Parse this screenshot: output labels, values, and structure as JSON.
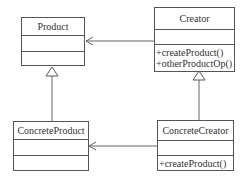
{
  "diagram": {
    "type": "uml-class-diagram",
    "classes": [
      {
        "id": "product",
        "name": "Product",
        "attributes": [],
        "operations": []
      },
      {
        "id": "creator",
        "name": "Creator",
        "attributes": [],
        "operations": [
          "+createProduct()",
          "+otherProductOp()"
        ]
      },
      {
        "id": "concrete_product",
        "name": "ConcreteProduct",
        "attributes": [],
        "operations": []
      },
      {
        "id": "concrete_creator",
        "name": "ConcreteCreator",
        "attributes": [],
        "operations": [
          "+createProduct()"
        ]
      }
    ],
    "relations": [
      {
        "from": "creator",
        "to": "product",
        "type": "dependency-arrow"
      },
      {
        "from": "concrete_creator",
        "to": "concrete_product",
        "type": "dependency-arrow"
      },
      {
        "from": "concrete_product",
        "to": "product",
        "type": "generalization"
      },
      {
        "from": "concrete_creator",
        "to": "creator",
        "type": "generalization"
      }
    ],
    "colors": {
      "line": "#555555",
      "text": "#333333",
      "background": "#ffffff"
    }
  }
}
